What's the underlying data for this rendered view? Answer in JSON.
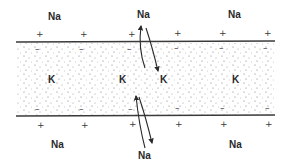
{
  "diagram": {
    "colors": {
      "background": "#ffffff",
      "ink": "#2a2a2a",
      "membrane_line": "#3a3a3a",
      "stipple": "#7a7a7a"
    },
    "outside_top": {
      "na_labels": [
        "Na",
        "Na",
        "Na"
      ],
      "charge_signs": [
        "+",
        "+",
        "+",
        "+",
        "+",
        "+"
      ]
    },
    "membrane_top_inner_signs": [
      "–",
      "–",
      "–",
      "–",
      "–",
      "–"
    ],
    "inside": {
      "k_labels": [
        "K",
        "K",
        "K",
        "K"
      ]
    },
    "membrane_bottom_inner_signs": [
      "–",
      "–",
      "–",
      "–",
      "–",
      "–"
    ],
    "outside_bottom": {
      "na_labels": [
        "Na",
        "Na",
        "Na"
      ],
      "charge_signs": [
        "+",
        "+",
        "+",
        "+",
        "+",
        "+"
      ]
    },
    "arrows": [
      {
        "name": "na-influx-top",
        "direction": "in"
      },
      {
        "name": "na-efflux-top",
        "direction": "out"
      },
      {
        "name": "na-influx-bottom",
        "direction": "in"
      },
      {
        "name": "na-efflux-bottom",
        "direction": "out"
      }
    ]
  }
}
